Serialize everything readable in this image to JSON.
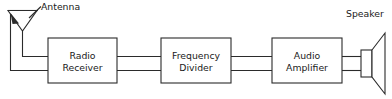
{
  "diagram": {
    "background_color": "#ffffff",
    "line_color": "#2b2b2b",
    "text_color": "#1a1a1a",
    "blocks": [
      {
        "id": "radio-receiver",
        "line1": "Radio",
        "line2": "Receiver"
      },
      {
        "id": "frequency-divider",
        "line1": "Frequency",
        "line2": "Divider"
      },
      {
        "id": "audio-amplifier",
        "line1": "Audio",
        "line2": "Amplifier"
      }
    ],
    "symbols": [
      {
        "id": "antenna",
        "label": "Antenna"
      },
      {
        "id": "speaker",
        "label": "Speaker"
      }
    ],
    "connections": [
      {
        "from": "antenna",
        "to": "radio-receiver",
        "wires": 2
      },
      {
        "from": "radio-receiver",
        "to": "frequency-divider",
        "wires": 2
      },
      {
        "from": "frequency-divider",
        "to": "audio-amplifier",
        "wires": 2
      },
      {
        "from": "audio-amplifier",
        "to": "speaker",
        "wires": 2
      }
    ]
  }
}
